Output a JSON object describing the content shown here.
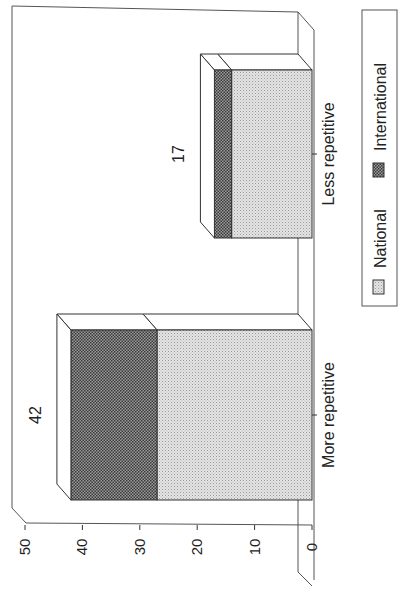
{
  "chart_data": {
    "type": "bar",
    "stacked": true,
    "three_d": true,
    "orientation": "rotated-90-ccw",
    "title": "",
    "xlabel": "",
    "ylabel": "",
    "categories": [
      "More repetitive",
      "Less repetitive"
    ],
    "series": [
      {
        "name": "National",
        "values": [
          27,
          14
        ],
        "pattern": "light-dotted",
        "color": "#d9d9d9"
      },
      {
        "name": "International",
        "values": [
          15,
          3
        ],
        "pattern": "dark-checker",
        "color": "#6e6e6e"
      }
    ],
    "totals": [
      42,
      17
    ],
    "total_labels": [
      "42",
      "17"
    ],
    "ylim": [
      0,
      50
    ],
    "yticks": [
      0,
      10,
      20,
      30,
      40,
      50
    ],
    "ytick_labels": [
      "0",
      "10",
      "20",
      "30",
      "40",
      "50"
    ],
    "grid": false,
    "legend": {
      "position": "right",
      "entries": [
        "National",
        "International"
      ]
    }
  }
}
